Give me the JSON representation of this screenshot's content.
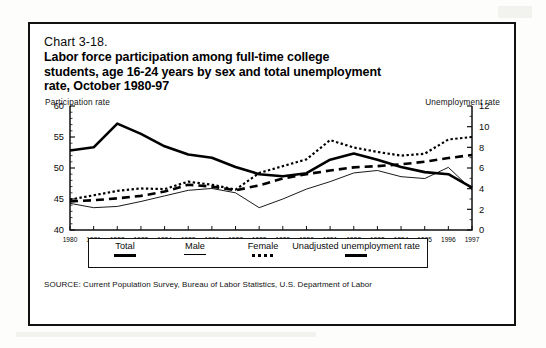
{
  "figure": {
    "chart_label": "Chart 3-18.",
    "title_lines": [
      "Labor force participation among full-time college",
      "students, age 16-24 years by sex and total unemployment",
      "rate, October 1980-97"
    ],
    "left_axis_caption": "Participation rate",
    "right_axis_caption": "Unemployment rate",
    "source": "SOURCE: Current Population Survey, Bureau of Labor Statistics, U.S. Department of Labor"
  },
  "legend": {
    "entries": [
      {
        "label": "Total",
        "style": "thick-solid"
      },
      {
        "label": "Male",
        "style": "thin-solid"
      },
      {
        "label": "Female",
        "style": "dotted"
      },
      {
        "label": "Unadjusted unemployment rate",
        "style": "thick-solid"
      }
    ]
  },
  "chart_data": {
    "type": "line",
    "title": "Chart 3-18. Labor force participation among full-time college students, age 16-24 years by sex and total unemployment rate, October 1980-97",
    "xlabel": "",
    "ylabel": "Participation rate",
    "y2label": "Unemployment rate",
    "grid": false,
    "legend_position": "bottom",
    "x": [
      1980,
      1981,
      1982,
      1983,
      1984,
      1985,
      1986,
      1987,
      1988,
      1989,
      1990,
      1991,
      1992,
      1993,
      1994,
      1995,
      1996,
      1997
    ],
    "xtick_labels": [
      "1980",
      "1981",
      "1982",
      "1983",
      "1984",
      "1985",
      "1986",
      "1987",
      "1988",
      "1989",
      "1990",
      "1991",
      "1992",
      "1993",
      "1994",
      "1995",
      "1996",
      "1997"
    ],
    "ylim": [
      40,
      60
    ],
    "yticks": [
      40,
      45,
      50,
      55,
      60
    ],
    "ytick_labels": [
      "40",
      "45",
      "50",
      "55",
      "60"
    ],
    "y2lim": [
      0,
      12
    ],
    "y2ticks": [
      0,
      2,
      4,
      6,
      8,
      10,
      12
    ],
    "y2tick_labels": [
      "0",
      "2",
      "4",
      "6",
      "8",
      "10",
      "12"
    ],
    "series": [
      {
        "name": "Total",
        "axis": "left",
        "style": "thick-dashed",
        "values": [
          44.6,
          44.8,
          45.1,
          45.5,
          46.2,
          47.3,
          47.0,
          46.4,
          47.2,
          48.3,
          49.0,
          49.6,
          50.1,
          50.3,
          50.6,
          51.0,
          51.6,
          52.1
        ]
      },
      {
        "name": "Male",
        "axis": "left",
        "style": "thin-solid",
        "values": [
          44.3,
          43.6,
          43.8,
          44.6,
          45.5,
          46.4,
          46.7,
          46.0,
          43.6,
          45.0,
          46.6,
          47.8,
          49.2,
          49.6,
          48.6,
          48.3,
          50.1,
          46.5
        ]
      },
      {
        "name": "Female",
        "axis": "left",
        "style": "dotted",
        "values": [
          44.9,
          45.6,
          46.3,
          46.7,
          46.6,
          47.8,
          47.3,
          46.5,
          49.2,
          50.3,
          51.4,
          54.5,
          53.3,
          52.6,
          52.0,
          52.3,
          54.6,
          55.0
        ]
      },
      {
        "name": "Unadjusted unemployment rate",
        "axis": "right",
        "style": "thick-solid",
        "values": [
          7.7,
          8.0,
          10.3,
          9.3,
          8.1,
          7.3,
          7.0,
          6.1,
          5.4,
          5.2,
          5.5,
          6.8,
          7.4,
          6.8,
          6.1,
          5.6,
          5.4,
          4.1
        ]
      }
    ]
  }
}
